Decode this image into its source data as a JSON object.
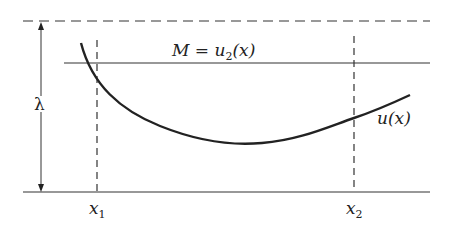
{
  "diagram": {
    "lines": {
      "upper_bound": {
        "style": "dashed",
        "y": 21
      },
      "M_line": {
        "style": "solid",
        "y": 63,
        "label": "M = u",
        "label_sub": "2",
        "label_tail": "(x)"
      },
      "baseline": {
        "style": "solid",
        "y": 192
      }
    },
    "lambda_arrow": {
      "label": "λ"
    },
    "verticals": [
      {
        "name": "x1",
        "label": "x",
        "sub": "1",
        "x": 97
      },
      {
        "name": "x2",
        "label": "x",
        "sub": "2",
        "x": 354
      }
    ],
    "curve": {
      "label": "u(x)"
    },
    "colors": {
      "stroke": "#222222",
      "background": "#ffffff"
    }
  }
}
